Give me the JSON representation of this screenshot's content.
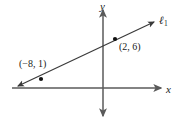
{
  "figure": {
    "background_color": "#ffffff",
    "axis_color": "#5a5a5a",
    "line_color": "#3a3a3a",
    "point_color": "#111111",
    "text_color": "#1a1a1a"
  },
  "axes": {
    "x_label": "x",
    "y_label": "y",
    "origin_px": {
      "x": 103,
      "y": 88
    },
    "x_axis_px": {
      "x1": 12,
      "y1": 88,
      "x2": 163,
      "y2": 88
    },
    "y_axis_px": {
      "x1": 103,
      "y1": 8,
      "x2": 103,
      "y2": 118
    },
    "x_arrows": "right",
    "y_arrows": "both",
    "ticks_shown": false,
    "gridlines_shown": false
  },
  "line": {
    "label": "ℓ",
    "label_subscript": "1",
    "arrows": "both",
    "start_px": {
      "x": 16,
      "y": 87
    },
    "end_px": {
      "x": 156,
      "y": 21
    }
  },
  "points": [
    {
      "label": "(−8, 1)",
      "x": -8,
      "y": 1,
      "dot_px": {
        "x": 41,
        "y": 79
      },
      "label_position": "above-left"
    },
    {
      "label": "(2, 6)",
      "x": 2,
      "y": 6,
      "dot_px": {
        "x": 115,
        "y": 39
      },
      "label_position": "below-right"
    }
  ]
}
